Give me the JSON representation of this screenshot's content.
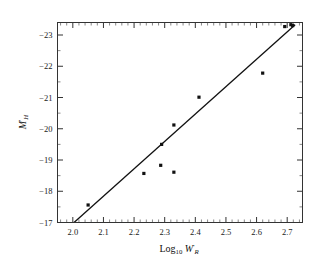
{
  "chart_data": {
    "type": "scatter",
    "title": "",
    "subtitle": "",
    "xlabel": "Log10 W'R",
    "ylabel": "M'H",
    "xlabel_parts": {
      "base": "Log",
      "base_sub": "10",
      "var": "W",
      "var_sup": "'",
      "var_sub": "R"
    },
    "ylabel_parts": {
      "var": "M",
      "var_sup": "'",
      "var_sub": "H"
    },
    "xlim": [
      1.95,
      2.75
    ],
    "ylim": [
      -17.0,
      -23.4
    ],
    "y_inverted": true,
    "grid": false,
    "legend": null,
    "xticks": [
      2.0,
      2.1,
      2.2,
      2.3,
      2.4,
      2.5,
      2.6,
      2.7
    ],
    "xticklabels": [
      "2.0",
      "2.1",
      "2.2",
      "2.3",
      "2.4",
      "2.5",
      "2.6",
      "2.7"
    ],
    "x_minor_step": 0.02,
    "yticks": [
      -23,
      -22,
      -21,
      -20,
      -19,
      -18,
      -17
    ],
    "yticklabels": [
      "-23",
      "-22",
      "-21",
      "-20",
      "-19",
      "-18",
      "-17"
    ],
    "y_minor_step": 0.5,
    "marker": "filled-square",
    "marker_color": "#111111",
    "line_color": "#111111",
    "frame_color": "#333333",
    "points": [
      {
        "x": 2.05,
        "y": -17.56
      },
      {
        "x": 2.232,
        "y": -18.57
      },
      {
        "x": 2.287,
        "y": -18.83
      },
      {
        "x": 2.29,
        "y": -19.5
      },
      {
        "x": 2.33,
        "y": -18.61
      },
      {
        "x": 2.33,
        "y": -20.12
      },
      {
        "x": 2.412,
        "y": -21.01
      },
      {
        "x": 2.62,
        "y": -21.78
      },
      {
        "x": 2.692,
        "y": -23.27
      },
      {
        "x": 2.712,
        "y": -23.33
      },
      {
        "x": 2.718,
        "y": -23.3
      }
    ],
    "fit_line": {
      "x0": 2.004,
      "y0": -17.0,
      "x1": 2.726,
      "y1": -23.33
    }
  }
}
